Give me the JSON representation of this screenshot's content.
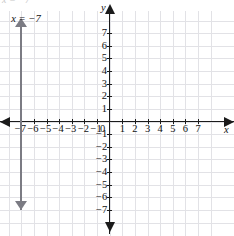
{
  "chart_data": {
    "type": "line",
    "title": "",
    "xlabel": "x",
    "ylabel": "y",
    "xlim": [
      -7.6,
      7.6
    ],
    "ylim": [
      -7.6,
      7.6
    ],
    "grid": true,
    "legend": null,
    "x_ticks": [
      -7,
      -6,
      -5,
      -4,
      -3,
      -2,
      -1,
      1,
      2,
      3,
      4,
      5,
      6,
      7
    ],
    "y_ticks": [
      7,
      6,
      5,
      4,
      3,
      2,
      1,
      -1,
      -2,
      -3,
      -4,
      -5,
      -6,
      -7
    ],
    "x_tick_labels": [
      "−7",
      "−6",
      "−5",
      "−4",
      "−3",
      "−2",
      "−1",
      "1",
      "2",
      "3",
      "4",
      "5",
      "6",
      "7"
    ],
    "y_tick_labels": [
      "7",
      "6",
      "5",
      "4",
      "3",
      "2",
      "1",
      "−1",
      "−2",
      "−3",
      "−4",
      "−5",
      "−6",
      "−7"
    ],
    "origin_label": "0",
    "series": [
      {
        "name": "x = −7",
        "type": "vertical-line",
        "equation": "x = −7",
        "x_value": -7,
        "color": "#7b7b83",
        "arrows": "both",
        "annotation": "x = −7"
      }
    ]
  },
  "annotations": {
    "line_label": "x = −7",
    "clipped_top_text": "x = −7"
  },
  "axes": {
    "x_name": "x",
    "y_name": "y",
    "origin": "0"
  },
  "colors": {
    "grid": "#e2e2e6",
    "axis": "#1b1b1b",
    "line": "#7b7b83",
    "text": "#111111",
    "background": "#ffffff"
  }
}
